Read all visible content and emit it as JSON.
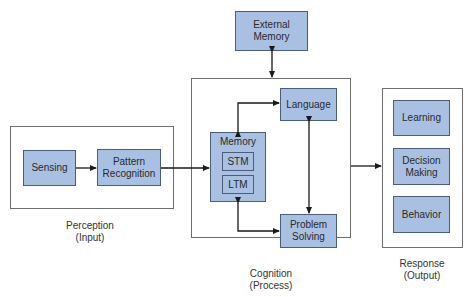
{
  "colors": {
    "box_fill": "#a9c0e3",
    "box_border": "#4c5d7c",
    "frame_border": "#6e6e6e",
    "arrow": "#1a1a1a"
  },
  "perception": {
    "caption_line1": "Perception",
    "caption_line2": "(Input)",
    "sensing": "Sensing",
    "pattern_line1": "Pattern",
    "pattern_line2": "Recognition"
  },
  "external_memory": {
    "line1": "External",
    "line2": "Memory"
  },
  "cognition": {
    "caption_line1": "Cognition",
    "caption_line2": "(Process)",
    "memory": "Memory",
    "stm": "STM",
    "ltm": "LTM",
    "language": "Language",
    "problem_line1": "Problem",
    "problem_line2": "Solving"
  },
  "response": {
    "caption_line1": "Response",
    "caption_line2": "(Output)",
    "learning": "Learning",
    "decision_line1": "Decision",
    "decision_line2": "Making",
    "behavior": "Behavior"
  }
}
